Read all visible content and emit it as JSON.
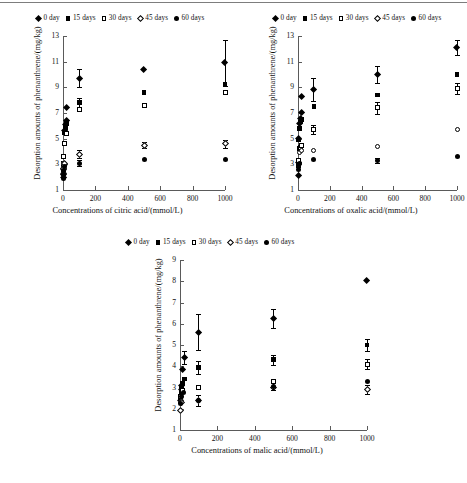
{
  "figure": {
    "legend_items": [
      {
        "label": "0 day",
        "marker": "filled-diamond"
      },
      {
        "label": "15 days",
        "marker": "filled-square"
      },
      {
        "label": "30 days",
        "marker": "open-square"
      },
      {
        "label": "45 days",
        "marker": "open-diamond"
      },
      {
        "label": "60 days",
        "marker": "filled-circle"
      }
    ]
  },
  "chart_data": [
    {
      "id": "citric",
      "type": "scatter",
      "title": "",
      "xlabel": "Concentrations of citric acid/(mmol/L)",
      "ylabel": "Desorption amounts of phenanthrene/(mg/kg)",
      "xlim": [
        0,
        1000
      ],
      "ylim": [
        1,
        13
      ],
      "xticks": [
        0,
        200,
        400,
        600,
        800,
        1000
      ],
      "yticks": [
        1,
        3,
        5,
        7,
        9,
        11,
        13
      ],
      "grid": false,
      "legend_position": "above",
      "series": [
        {
          "name": "0 day",
          "marker": "filled-diamond",
          "points": [
            {
              "x": 1,
              "y": 2.0,
              "err": 0
            },
            {
              "x": 3,
              "y": 2.3,
              "err": 0
            },
            {
              "x": 5,
              "y": 2.6,
              "err": 0
            },
            {
              "x": 8,
              "y": 3.0,
              "err": 0
            },
            {
              "x": 10,
              "y": 5.6,
              "err": 0
            },
            {
              "x": 15,
              "y": 6.1,
              "err": 0
            },
            {
              "x": 20,
              "y": 6.4,
              "err": 0
            },
            {
              "x": 25,
              "y": 7.4,
              "err": 0
            },
            {
              "x": 100,
              "y": 9.7,
              "err": 0.7
            },
            {
              "x": 500,
              "y": 10.4,
              "err": 0
            },
            {
              "x": 1000,
              "y": 10.9,
              "err": 1.8
            }
          ]
        },
        {
          "name": "15 days",
          "marker": "filled-square",
          "points": [
            {
              "x": 1,
              "y": 2.1,
              "err": 0
            },
            {
              "x": 3,
              "y": 2.5,
              "err": 0
            },
            {
              "x": 5,
              "y": 3.1,
              "err": 0
            },
            {
              "x": 10,
              "y": 5.5,
              "err": 0
            },
            {
              "x": 15,
              "y": 5.9,
              "err": 0
            },
            {
              "x": 20,
              "y": 6.2,
              "err": 0
            },
            {
              "x": 100,
              "y": 7.8,
              "err": 0.35
            },
            {
              "x": 500,
              "y": 8.6,
              "err": 0
            },
            {
              "x": 1000,
              "y": 9.2,
              "err": 0
            }
          ]
        },
        {
          "name": "30 days",
          "marker": "open-square",
          "points": [
            {
              "x": 1,
              "y": 2.3,
              "err": 0
            },
            {
              "x": 3,
              "y": 2.9,
              "err": 0
            },
            {
              "x": 5,
              "y": 3.6,
              "err": 0
            },
            {
              "x": 10,
              "y": 4.6,
              "err": 0
            },
            {
              "x": 20,
              "y": 5.4,
              "err": 0
            },
            {
              "x": 100,
              "y": 7.3,
              "err": 0
            },
            {
              "x": 500,
              "y": 7.6,
              "err": 0
            },
            {
              "x": 1000,
              "y": 8.6,
              "err": 0
            }
          ]
        },
        {
          "name": "45 days",
          "marker": "open-diamond",
          "points": [
            {
              "x": 1,
              "y": 2.2,
              "err": 0
            },
            {
              "x": 5,
              "y": 2.7,
              "err": 0
            },
            {
              "x": 10,
              "y": 3.1,
              "err": 0
            },
            {
              "x": 100,
              "y": 3.8,
              "err": 0.3
            },
            {
              "x": 500,
              "y": 4.5,
              "err": 0.25
            },
            {
              "x": 1000,
              "y": 4.6,
              "err": 0.3
            }
          ]
        },
        {
          "name": "60 days",
          "marker": "filled-circle",
          "points": [
            {
              "x": 1,
              "y": 1.9,
              "err": 0
            },
            {
              "x": 3,
              "y": 2.2,
              "err": 0
            },
            {
              "x": 5,
              "y": 2.5,
              "err": 0
            },
            {
              "x": 8,
              "y": 2.8,
              "err": 0
            },
            {
              "x": 100,
              "y": 3.1,
              "err": 0.25
            },
            {
              "x": 500,
              "y": 3.35,
              "err": 0
            },
            {
              "x": 1000,
              "y": 3.4,
              "err": 0
            }
          ]
        }
      ]
    },
    {
      "id": "oxalic",
      "type": "scatter",
      "title": "",
      "xlabel": "Concentrations of oxalic acid/(mmol/L)",
      "ylabel": "Desorption amounts of phenanthrene/(mg/kg)",
      "xlim": [
        0,
        1000
      ],
      "ylim": [
        1,
        13
      ],
      "xticks": [
        0,
        200,
        400,
        600,
        800,
        1000
      ],
      "yticks": [
        1,
        3,
        5,
        7,
        9,
        11,
        13
      ],
      "grid": false,
      "legend_position": "above",
      "series": [
        {
          "name": "0 day",
          "marker": "filled-diamond",
          "points": [
            {
              "x": 1,
              "y": 2.1,
              "err": 0
            },
            {
              "x": 3,
              "y": 3.1,
              "err": 0
            },
            {
              "x": 6,
              "y": 5.0,
              "err": 0
            },
            {
              "x": 10,
              "y": 6.2,
              "err": 0
            },
            {
              "x": 15,
              "y": 6.6,
              "err": 0
            },
            {
              "x": 20,
              "y": 7.0,
              "err": 0
            },
            {
              "x": 25,
              "y": 8.3,
              "err": 0
            },
            {
              "x": 100,
              "y": 8.8,
              "err": 0.9
            },
            {
              "x": 500,
              "y": 10.0,
              "err": 0.7
            },
            {
              "x": 1000,
              "y": 12.1,
              "err": 0.6
            }
          ]
        },
        {
          "name": "15 days",
          "marker": "filled-square",
          "points": [
            {
              "x": 1,
              "y": 2.9,
              "err": 0
            },
            {
              "x": 5,
              "y": 4.9,
              "err": 0
            },
            {
              "x": 10,
              "y": 5.8,
              "err": 0
            },
            {
              "x": 15,
              "y": 6.3,
              "err": 0
            },
            {
              "x": 20,
              "y": 6.5,
              "err": 0
            },
            {
              "x": 100,
              "y": 7.5,
              "err": 0
            },
            {
              "x": 500,
              "y": 8.4,
              "err": 0
            },
            {
              "x": 1000,
              "y": 10.0,
              "err": 0
            }
          ]
        },
        {
          "name": "30 days",
          "marker": "open-square",
          "points": [
            {
              "x": 3,
              "y": 3.3,
              "err": 0
            },
            {
              "x": 8,
              "y": 4.2,
              "err": 0
            },
            {
              "x": 15,
              "y": 4.3,
              "err": 0
            },
            {
              "x": 25,
              "y": 4.5,
              "err": 0
            },
            {
              "x": 100,
              "y": 5.7,
              "err": 0.35
            },
            {
              "x": 500,
              "y": 7.4,
              "err": 0.45
            },
            {
              "x": 1000,
              "y": 8.9,
              "err": 0.45
            }
          ]
        },
        {
          "name": "45 days",
          "marker": "open-circle",
          "points": [
            {
              "x": 2,
              "y": 3.0,
              "err": 0
            },
            {
              "x": 8,
              "y": 3.9,
              "err": 0
            },
            {
              "x": 20,
              "y": 4.1,
              "err": 0
            },
            {
              "x": 100,
              "y": 4.1,
              "err": 0
            },
            {
              "x": 500,
              "y": 4.4,
              "err": 0
            },
            {
              "x": 1000,
              "y": 5.7,
              "err": 0
            }
          ]
        },
        {
          "name": "60 days",
          "marker": "filled-circle",
          "points": [
            {
              "x": 1,
              "y": 2.6,
              "err": 0
            },
            {
              "x": 5,
              "y": 3.0,
              "err": 0
            },
            {
              "x": 12,
              "y": 3.1,
              "err": 0
            },
            {
              "x": 100,
              "y": 3.4,
              "err": 0
            },
            {
              "x": 500,
              "y": 3.3,
              "err": 0.2
            },
            {
              "x": 1000,
              "y": 3.6,
              "err": 0
            }
          ]
        }
      ]
    },
    {
      "id": "malic",
      "type": "scatter",
      "title": "",
      "xlabel": "Concentrations of malic acid/(mmol/L)",
      "ylabel": "Desorption amounts of phenanthrene/(mg/kg)",
      "xlim": [
        0,
        1000
      ],
      "ylim": [
        1,
        9
      ],
      "xticks": [
        0,
        200,
        400,
        600,
        800,
        1000
      ],
      "yticks": [
        1,
        2,
        3,
        4,
        5,
        6,
        7,
        8,
        9
      ],
      "grid": false,
      "legend_position": "above",
      "series": [
        {
          "name": "0 day",
          "marker": "filled-diamond",
          "points": [
            {
              "x": 2,
              "y": 2.4,
              "err": 0
            },
            {
              "x": 6,
              "y": 2.9,
              "err": 0
            },
            {
              "x": 10,
              "y": 3.1,
              "err": 0
            },
            {
              "x": 15,
              "y": 3.85,
              "err": 0
            },
            {
              "x": 22,
              "y": 4.4,
              "err": 0.3
            },
            {
              "x": 100,
              "y": 5.6,
              "err": 0.85
            },
            {
              "x": 500,
              "y": 6.25,
              "err": 0.45
            },
            {
              "x": 1000,
              "y": 8.05,
              "err": 0
            }
          ]
        },
        {
          "name": "15 days",
          "marker": "filled-square",
          "points": [
            {
              "x": 2,
              "y": 2.45,
              "err": 0
            },
            {
              "x": 6,
              "y": 2.8,
              "err": 0
            },
            {
              "x": 10,
              "y": 3.0,
              "err": 0
            },
            {
              "x": 15,
              "y": 3.2,
              "err": 0
            },
            {
              "x": 22,
              "y": 3.4,
              "err": 0
            },
            {
              "x": 100,
              "y": 3.95,
              "err": 0.3
            },
            {
              "x": 500,
              "y": 4.3,
              "err": 0.25
            },
            {
              "x": 1000,
              "y": 5.0,
              "err": 0.3
            }
          ]
        },
        {
          "name": "30 days",
          "marker": "open-square",
          "points": [
            {
              "x": 4,
              "y": 2.6,
              "err": 0
            },
            {
              "x": 12,
              "y": 2.85,
              "err": 0
            },
            {
              "x": 100,
              "y": 3.0,
              "err": 0
            },
            {
              "x": 500,
              "y": 3.3,
              "err": 0
            },
            {
              "x": 1000,
              "y": 4.1,
              "err": 0.25
            }
          ]
        },
        {
          "name": "45 days",
          "marker": "open-diamond",
          "points": [
            {
              "x": 2,
              "y": 1.9,
              "err": 0
            },
            {
              "x": 8,
              "y": 2.3,
              "err": 0
            },
            {
              "x": 100,
              "y": 2.4,
              "err": 0.25
            },
            {
              "x": 500,
              "y": 3.0,
              "err": 0
            },
            {
              "x": 1000,
              "y": 2.9,
              "err": 0.2
            }
          ]
        },
        {
          "name": "60 days",
          "marker": "filled-circle",
          "points": [
            {
              "x": 3,
              "y": 2.25,
              "err": 0
            },
            {
              "x": 10,
              "y": 2.6,
              "err": 0
            },
            {
              "x": 18,
              "y": 2.75,
              "err": 0
            },
            {
              "x": 100,
              "y": 2.4,
              "err": 0
            },
            {
              "x": 500,
              "y": 3.05,
              "err": 0.15
            },
            {
              "x": 1000,
              "y": 3.3,
              "err": 0
            }
          ]
        }
      ]
    }
  ]
}
